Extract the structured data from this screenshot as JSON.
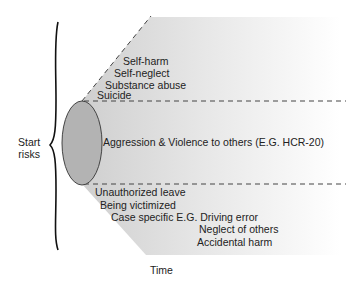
{
  "diagram": {
    "start_label": [
      "Start",
      "risks"
    ],
    "axis_label": "Time",
    "upper_group": {
      "name": "self-directed risks",
      "items": [
        "Self-harm",
        "Self-neglect",
        "Substance abuse",
        "Suicide"
      ]
    },
    "middle_group": {
      "name": "violence risks",
      "items": [
        "Aggression & Violence to others (E.G. HCR-20)"
      ]
    },
    "lower_group": {
      "name": "other risks",
      "items": [
        "Unauthorized leave",
        "Being victimized",
        "Case specific E.G. Driving error",
        "Neglect of others",
        "Accidental harm"
      ]
    },
    "colors": {
      "ellipse_fill": "#b3b3b3",
      "fan_fill": "#d9d9d9",
      "lines": "#333333",
      "background": "#ffffff"
    }
  }
}
